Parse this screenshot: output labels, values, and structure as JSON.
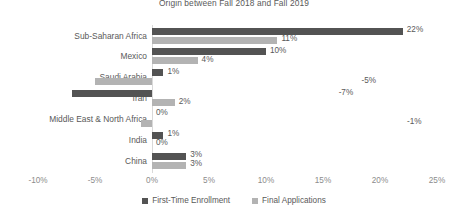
{
  "chart_data": {
    "type": "bar",
    "orientation": "horizontal",
    "title": "Origin between Fall 2018 and Fall 2019",
    "xlabel": "",
    "ylabel": "",
    "xlim": [
      -10,
      25
    ],
    "xticks": [
      "-10%",
      "-5%",
      "0%",
      "5%",
      "10%",
      "15%",
      "20%",
      "25%"
    ],
    "xtick_values": [
      -10,
      -5,
      0,
      5,
      10,
      15,
      20,
      25
    ],
    "grid": false,
    "legend_position": "bottom",
    "categories": [
      "Sub-Saharan Africa",
      "Mexico",
      "Saudi Arabia",
      "Iran",
      "Middle East & North Africa",
      "India",
      "China"
    ],
    "series": [
      {
        "name": "First-Time Enrollment",
        "color": "#535353",
        "values": [
          22,
          10,
          1,
          -7,
          0,
          1,
          3
        ],
        "labels": [
          "22%",
          "10%",
          "1%",
          "-7%",
          "0%",
          "1%",
          "3%"
        ]
      },
      {
        "name": "Final Applications",
        "color": "#b3b3b3",
        "values": [
          11,
          4,
          -5,
          2,
          -1,
          0,
          3
        ],
        "labels": [
          "11%",
          "4%",
          "-5%",
          "2%",
          "-1%",
          "0%",
          "3%"
        ]
      }
    ]
  }
}
